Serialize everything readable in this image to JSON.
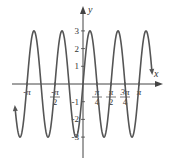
{
  "chart_data": {
    "type": "line",
    "title": "",
    "function": "y = 3 sin(4x)",
    "xlabel": "x",
    "ylabel": "y",
    "xlim": [
      -3.81,
      3.87
    ],
    "ylim": [
      -3.5,
      3.5
    ],
    "grid": false,
    "legend": null,
    "x_ticks": [
      {
        "value": -3.14159,
        "label": "-π"
      },
      {
        "value": -1.5708,
        "label": "-π/2"
      },
      {
        "value": 0.7854,
        "label": "π/4"
      },
      {
        "value": 1.5708,
        "label": "π/2"
      },
      {
        "value": 2.3562,
        "label": "3π/4"
      },
      {
        "value": 3.14159,
        "label": "π"
      }
    ],
    "y_ticks": [
      {
        "value": 3,
        "label": "3"
      },
      {
        "value": 2,
        "label": "2"
      },
      {
        "value": 1,
        "label": "1"
      },
      {
        "value": -1,
        "label": "-1"
      },
      {
        "value": -2,
        "label": "-2"
      },
      {
        "value": -3,
        "label": "-3"
      }
    ],
    "series": [
      {
        "name": "3 sin 4x",
        "amplitude": 3,
        "period": 1.5708,
        "color": "#555555",
        "x": [
          -3.5343,
          -3.1416,
          -2.7489,
          -2.3562,
          -1.9635,
          -1.5708,
          -1.1781,
          -0.7854,
          -0.3927,
          0,
          0.3927,
          0.7854,
          1.1781,
          1.5708,
          1.9635,
          2.3562,
          2.7489,
          3.1416,
          3.5343
        ],
        "y": [
          -3,
          0,
          3,
          0,
          -3,
          0,
          3,
          0,
          -3,
          0,
          3,
          0,
          -3,
          0,
          3,
          0,
          -3,
          0,
          3
        ]
      }
    ]
  },
  "axes": {
    "x_name": "x",
    "y_name": "y"
  },
  "colors": {
    "curve": "#555555",
    "axis": "#444444",
    "text": "#333333"
  }
}
